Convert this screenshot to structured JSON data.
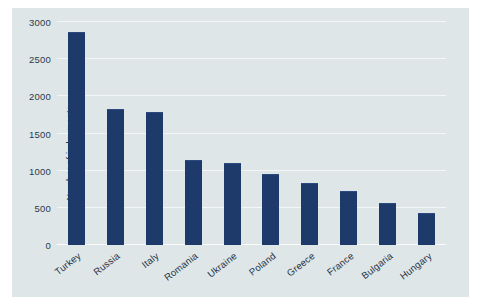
{
  "chart_data": {
    "type": "bar",
    "title": "",
    "xlabel": "",
    "ylabel": "Number of judgements",
    "categories": [
      "Turkey",
      "Russia",
      "Italy",
      "Romania",
      "Ukraine",
      "Poland",
      "Greece",
      "France",
      "Bulgaria",
      "Hungary"
    ],
    "values": [
      2870,
      1830,
      1790,
      1150,
      1110,
      950,
      840,
      720,
      560,
      430
    ],
    "ylim": [
      0,
      3000
    ],
    "yticks": [
      0,
      500,
      1000,
      1500,
      2000,
      2500,
      3000
    ],
    "ytick_labels": [
      "0",
      "500",
      "1000",
      "1500",
      "2000",
      "2500",
      "3000"
    ],
    "grid": true,
    "legend": false,
    "bar_color": "#1e3a6b",
    "plot_background": "#dfe6e8",
    "gridline_color": "#f2f6f7"
  }
}
